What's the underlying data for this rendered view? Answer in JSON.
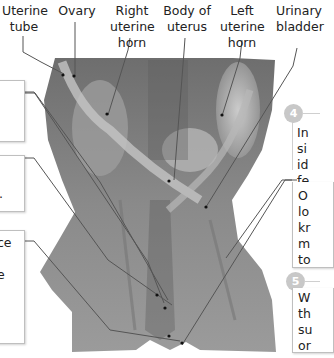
{
  "labels": {
    "uterine_tube": [
      "Uterine",
      "tube"
    ],
    "ovary": [
      "Ovary"
    ],
    "right_uterine_horn": [
      "Right",
      "uterine",
      "horn"
    ],
    "body_of_uterus": [
      "Body of",
      "uterus"
    ],
    "left_uterine_horn": [
      "Left",
      "uterine",
      "horn"
    ],
    "urinary_bladder": [
      "Urinary",
      "bladder"
    ]
  },
  "left_boxes": [
    {
      "text": ""
    },
    {
      "text": "."
    },
    {
      "text": "ce"
    },
    {
      "text": "e"
    }
  ],
  "steps": [
    {
      "number": "4",
      "color": "#c8c8c8",
      "lines": [
        "In",
        "si",
        "id",
        "fe"
      ]
    },
    {
      "number": "",
      "lines": [
        "O",
        "lo",
        "kr",
        "m",
        "to"
      ]
    },
    {
      "number": "5",
      "color": "#c8c8c8",
      "lines": [
        "W",
        "th",
        "su",
        "or"
      ]
    }
  ],
  "image": {
    "subject": "dissection-photo-female-reproductive-tract",
    "tone": "grayscale"
  }
}
